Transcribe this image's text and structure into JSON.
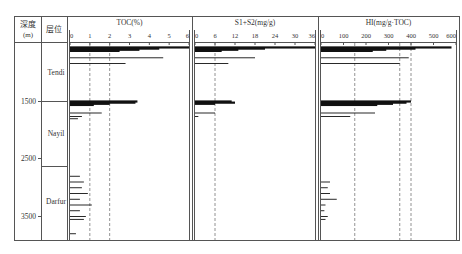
{
  "header": {
    "depth_label": "深度",
    "depth_unit": "(m)",
    "formation_label": "层位"
  },
  "depth_ticks": [
    "1500",
    "2500",
    "3500"
  ],
  "formations": [
    "Tendi",
    "Nayil",
    "Darfur"
  ],
  "panels": [
    {
      "title": "TOC(%)",
      "ticks": [
        "0",
        "1",
        "2",
        "3",
        "4",
        "5",
        "6"
      ]
    },
    {
      "title": "S1+S2(mg/g)",
      "ticks": [
        "0",
        "6",
        "12",
        "18",
        "24",
        "30",
        "36"
      ]
    },
    {
      "title": "HI(mg/g·TOC)",
      "ticks": [
        "0",
        "100",
        "200",
        "300",
        "400",
        "500",
        "600"
      ]
    }
  ],
  "chart_data": {
    "type": "bar",
    "orientation": "horizontal",
    "title": "",
    "ylabel": "深度(m)",
    "y_ticks": [
      1500,
      2500,
      3500
    ],
    "y_direction": "depth increasing downward",
    "formations": [
      {
        "name": "Tendi",
        "top_m": 500,
        "base_m": 1500
      },
      {
        "name": "Nayil",
        "top_m": 1500,
        "base_m": 2650
      },
      {
        "name": "Darfur",
        "top_m": 2650,
        "base_m": 3900
      }
    ],
    "series": [
      {
        "name": "TOC(%)",
        "xlim": [
          0,
          6
        ],
        "x_ticks": [
          0,
          1,
          2,
          3,
          4,
          5,
          6
        ],
        "reference_lines": [
          1,
          2
        ],
        "depth_m": [
          560,
          580,
          600,
          620,
          740,
          840,
          1500,
          1520,
          1540,
          1560,
          1700,
          1760,
          1800,
          2800,
          2900,
          3000,
          3100,
          3200,
          3300,
          3400,
          3500,
          3550,
          3800
        ],
        "values": [
          6.0,
          4.5,
          3.5,
          2.5,
          4.7,
          2.8,
          3.4,
          3.3,
          2.0,
          1.2,
          1.6,
          0.6,
          0.4,
          0.5,
          0.7,
          0.6,
          0.9,
          0.5,
          1.1,
          0.5,
          0.8,
          0.7,
          0.3
        ]
      },
      {
        "name": "S1+S2(mg/g)",
        "xlim": [
          0,
          36
        ],
        "x_ticks": [
          0,
          6,
          12,
          18,
          24,
          30,
          36
        ],
        "reference_lines": [
          6
        ],
        "depth_m": [
          560,
          580,
          600,
          620,
          740,
          840,
          1500,
          1520,
          1540,
          1700,
          1760
        ],
        "values": [
          36,
          21,
          13,
          8,
          18,
          10,
          11,
          12,
          6,
          6,
          1
        ]
      },
      {
        "name": "HI(mg/g·TOC)",
        "xlim": [
          0,
          600
        ],
        "x_ticks": [
          0,
          100,
          200,
          300,
          400,
          500,
          600
        ],
        "reference_lines": [
          150,
          350,
          400
        ],
        "depth_m": [
          560,
          580,
          600,
          620,
          740,
          840,
          1500,
          1520,
          1540,
          1560,
          1700,
          1760,
          2900,
          3000,
          3100,
          3200,
          3300,
          3400,
          3500,
          3550
        ],
        "values": [
          580,
          420,
          290,
          230,
          390,
          350,
          400,
          380,
          320,
          250,
          240,
          130,
          40,
          30,
          40,
          70,
          20,
          15,
          30,
          20
        ]
      }
    ]
  }
}
